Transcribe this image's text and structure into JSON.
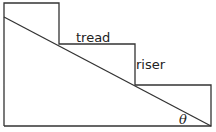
{
  "diagram": {
    "title": "",
    "labels": {
      "tread": "tread",
      "riser": "riser",
      "angle": "θ"
    },
    "colors": {
      "stroke": "#333333",
      "background": "#ffffff"
    }
  }
}
